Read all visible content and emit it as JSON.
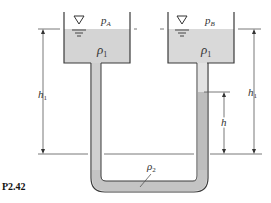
{
  "figure": {
    "caption": "P2.42",
    "tank_a": {
      "pressure_label": "p",
      "pressure_sub": "A",
      "fluid_label": "ρ",
      "fluid_sub": "1"
    },
    "tank_b": {
      "pressure_label": "p",
      "pressure_sub": "B",
      "fluid_label": "ρ",
      "fluid_sub": "1"
    },
    "manometer_fluid": {
      "label": "ρ",
      "sub": "2"
    },
    "dimensions": {
      "h1_left": {
        "label": "h",
        "sub": "1"
      },
      "h1_right": {
        "label": "h",
        "sub": "1"
      },
      "h": {
        "label": "h"
      }
    },
    "colors": {
      "fluid1": "#d2d2d2",
      "fluid2": "#b9b9b9",
      "wall": "#3a3a3a",
      "line": "#555555"
    }
  }
}
